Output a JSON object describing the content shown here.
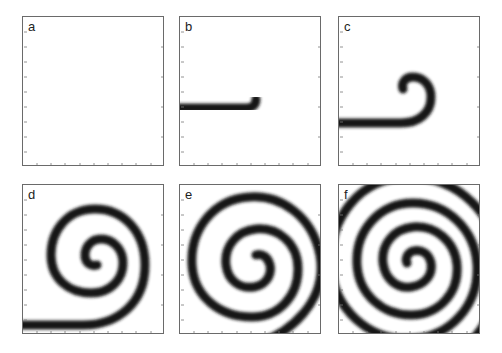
{
  "figure": {
    "panels": [
      {
        "id": "a",
        "label": "a",
        "stage": "straight broken wavefront"
      },
      {
        "id": "b",
        "label": "b",
        "stage": "wavefront tip begins to curl"
      },
      {
        "id": "c",
        "label": "c",
        "stage": "tip curls into small hook"
      },
      {
        "id": "d",
        "label": "d",
        "stage": "spiral with ~1.5 turns"
      },
      {
        "id": "e",
        "label": "e",
        "stage": "spiral with ~2 turns"
      },
      {
        "id": "f",
        "label": "f",
        "stage": "fully developed spiral filling panel"
      }
    ],
    "colors": {
      "wave": "#151515",
      "background": "#ffffff",
      "frame": "#6a6a6a"
    }
  }
}
